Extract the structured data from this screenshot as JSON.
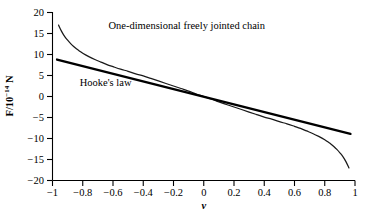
{
  "chart_data": {
    "type": "line",
    "title": "",
    "subtitle": "",
    "xlabel": "v",
    "ylabel": "F/10^-14 N",
    "ylabel_parts": {
      "prefix": "F/10",
      "exponent": "−14",
      "suffix": " N"
    },
    "xlim": [
      -1,
      1
    ],
    "ylim": [
      -20,
      20
    ],
    "grid": false,
    "legend_position": "inline-annotations",
    "xticks": [
      "−1",
      "−0.8",
      "−0.6",
      "−0.4",
      "−0.2",
      "0",
      "0.2",
      "0.4",
      "0.6",
      "0.8",
      "1"
    ],
    "xtick_values": [
      -1,
      -0.8,
      -0.6,
      -0.4,
      -0.2,
      0,
      0.2,
      0.4,
      0.6,
      0.8,
      1
    ],
    "yticks": [
      "20",
      "15",
      "10",
      "5",
      "0",
      "−5",
      "−10",
      "−15",
      "−20"
    ],
    "ytick_values": [
      20,
      15,
      10,
      5,
      0,
      -5,
      -10,
      -15,
      -20
    ],
    "annotations": [
      {
        "text": "One-dimensional freely jointed chain",
        "x": -0.63,
        "y": 16.0
      },
      {
        "text": "Hooke's law",
        "x": -0.82,
        "y": 2.4
      }
    ],
    "series": [
      {
        "name": "One-dimensional freely jointed chain",
        "style": "curve-thin",
        "color": "#1a1a1a",
        "x": [
          -0.96,
          -0.94,
          -0.92,
          -0.9,
          -0.88,
          -0.86,
          -0.84,
          -0.82,
          -0.8,
          -0.76,
          -0.72,
          -0.68,
          -0.64,
          -0.6,
          -0.55,
          -0.5,
          -0.45,
          -0.4,
          -0.35,
          -0.3,
          -0.25,
          -0.2,
          -0.15,
          -0.1,
          -0.05,
          0,
          0.05,
          0.1,
          0.15,
          0.2,
          0.25,
          0.3,
          0.35,
          0.4,
          0.45,
          0.5,
          0.55,
          0.6,
          0.64,
          0.68,
          0.72,
          0.76,
          0.8,
          0.82,
          0.84,
          0.86,
          0.88,
          0.9,
          0.92,
          0.94,
          0.96
        ],
        "y": [
          17.0,
          15.5,
          14.3,
          13.4,
          12.6,
          11.9,
          11.3,
          10.8,
          10.3,
          9.5,
          8.8,
          8.2,
          7.6,
          7.1,
          6.5,
          6.0,
          5.4,
          4.9,
          4.3,
          3.7,
          3.1,
          2.5,
          1.9,
          1.3,
          0.6,
          0.0,
          -0.6,
          -1.3,
          -1.9,
          -2.5,
          -3.1,
          -3.7,
          -4.3,
          -4.9,
          -5.4,
          -6.0,
          -6.5,
          -7.1,
          -7.6,
          -8.2,
          -8.8,
          -9.5,
          -10.3,
          -10.8,
          -11.3,
          -11.9,
          -12.6,
          -13.4,
          -14.3,
          -15.5,
          -17.0
        ]
      },
      {
        "name": "Hooke's law",
        "style": "line-thick",
        "color": "#000000",
        "x": [
          -0.97,
          0.97
        ],
        "y": [
          8.8,
          -8.9
        ]
      }
    ]
  },
  "figure": {
    "background_color": "#ffffff",
    "axis_color": "#000000"
  }
}
